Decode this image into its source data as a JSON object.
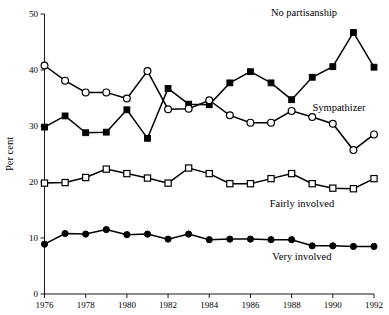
{
  "chart_data": {
    "type": "line",
    "title": "",
    "subtitle": "",
    "xlabel": "",
    "ylabel": "Per cent",
    "xlim": [
      1976,
      1992
    ],
    "ylim": [
      0,
      50
    ],
    "grid": false,
    "legend_position": "inline-right",
    "x": [
      1976,
      1977,
      1978,
      1979,
      1980,
      1981,
      1982,
      1983,
      1984,
      1985,
      1986,
      1987,
      1988,
      1989,
      1990,
      1991,
      1992
    ],
    "x_tick_labels": [
      "1976",
      "1978",
      "1980",
      "1982",
      "1984",
      "1986",
      "1988",
      "1990",
      "1992"
    ],
    "x_ticks": [
      1976,
      1978,
      1980,
      1982,
      1984,
      1986,
      1988,
      1990,
      1992
    ],
    "y_ticks": [
      0,
      10,
      20,
      30,
      40,
      50
    ],
    "y_tick_labels": [
      "0",
      "10",
      "20",
      "30",
      "40",
      "50"
    ],
    "series": [
      {
        "name": "No partisanship",
        "marker": "filled-square",
        "label_x": 1988.6,
        "label_y": 49.6,
        "values": [
          29.8,
          31.8,
          28.8,
          28.9,
          32.9,
          27.8,
          36.7,
          33.9,
          33.8,
          37.7,
          39.7,
          37.7,
          34.7,
          38.7,
          40.6,
          46.7,
          40.5
        ]
      },
      {
        "name": "Sympathizer",
        "marker": "open-circle",
        "label_x": 1990.3,
        "label_y": 32.6,
        "values": [
          40.8,
          38.1,
          36.0,
          36.0,
          34.9,
          39.8,
          33.0,
          33.1,
          34.6,
          31.9,
          30.6,
          30.6,
          32.7,
          31.6,
          30.4,
          25.7,
          28.5
        ]
      },
      {
        "name": "Fairly involved",
        "marker": "open-square",
        "label_x": 1988.5,
        "label_y": 15.6,
        "values": [
          19.8,
          19.9,
          20.8,
          22.3,
          21.5,
          20.7,
          19.8,
          22.5,
          21.5,
          19.7,
          19.7,
          20.6,
          21.5,
          19.7,
          18.9,
          18.8,
          20.6
        ]
      },
      {
        "name": "Very involved",
        "marker": "filled-circle",
        "label_x": 1988.5,
        "label_y": 6.1,
        "values": [
          8.9,
          10.8,
          10.7,
          11.5,
          10.6,
          10.7,
          9.8,
          10.7,
          9.7,
          9.8,
          9.8,
          9.7,
          9.7,
          8.6,
          8.6,
          8.5,
          8.5
        ]
      }
    ]
  }
}
